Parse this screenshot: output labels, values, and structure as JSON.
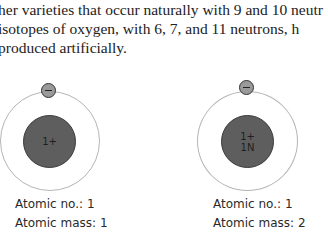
{
  "text": {
    "lines": [
      "her varieties that occur naturally with 9 and 10 neutr",
      " isotopes of oxygen, with 6, 7, and 11 neutrons, h",
      " produced artificially."
    ]
  },
  "atoms": [
    {
      "nucleus_lines": [
        "1+"
      ],
      "electron": "−",
      "atomic_no_label": "Atomic no.: 1",
      "atomic_mass_label": "Atomic mass: 1"
    },
    {
      "nucleus_lines": [
        "1+",
        "1N"
      ],
      "electron": "−",
      "atomic_no_label": "Atomic no.: 1",
      "atomic_mass_label": "Atomic mass: 2"
    }
  ],
  "colors": {
    "nucleus": "#5e5e5e",
    "electron": "#9a9a9a",
    "orbit": "#b5b5b5"
  }
}
